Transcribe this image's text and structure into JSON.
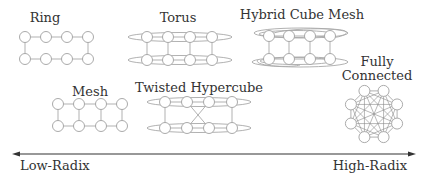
{
  "topologies": {
    "ring": {
      "label": "Ring"
    },
    "torus": {
      "label": "Torus"
    },
    "hybrid_cube_mesh": {
      "label": "Hybrid Cube Mesh"
    },
    "mesh": {
      "label": "Mesh"
    },
    "twisted_hypercube": {
      "label": "Twisted Hypercube"
    },
    "fully_connected": {
      "label_line1": "Fully",
      "label_line2": "Connected"
    }
  },
  "axis": {
    "left_label": "Low-Radix",
    "right_label": "High-Radix",
    "direction": "bidirectional"
  },
  "colors": {
    "edge": "#a8a8a8",
    "node_stroke": "#a0a0a0",
    "text": "#333333",
    "axis": "#333333"
  }
}
